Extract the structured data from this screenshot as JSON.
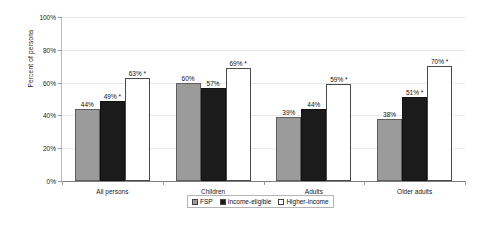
{
  "chart_data": {
    "type": "bar",
    "title": "",
    "subtitle": "",
    "xlabel": "",
    "ylabel": "Percent of persons",
    "ylim": [
      0,
      100
    ],
    "ytick_labels": [
      "100%",
      "80%",
      "60%",
      "40%",
      "20%",
      "0%"
    ],
    "ytick_values": [
      100,
      80,
      60,
      40,
      20,
      0
    ],
    "grid": true,
    "legend_position": "bottom-center",
    "categories": [
      "All persons",
      "Children",
      "Adults",
      "Older adults"
    ],
    "series": [
      {
        "name": "FSP",
        "color": "#9b9b9b",
        "values": [
          44,
          60,
          39,
          38
        ],
        "labels": [
          "44%",
          "60%",
          "39%",
          "38%"
        ]
      },
      {
        "name": "Income-eligible",
        "color": "#1b1b1b",
        "values": [
          49,
          57,
          44,
          51
        ],
        "labels": [
          "49% *",
          "57%",
          "44%",
          "51% *"
        ]
      },
      {
        "name": "Higher-income",
        "color": "#ffffff",
        "values": [
          63,
          69,
          59,
          70
        ],
        "labels": [
          "63% *",
          "69% *",
          "59% *",
          "70% *"
        ]
      }
    ],
    "annotations": [
      "* denotes statistical significance marker on labeled bars"
    ]
  },
  "legend": {
    "items": [
      {
        "label": "FSP",
        "swatch": "gray-swatch"
      },
      {
        "label": "Income-eligible",
        "swatch": "black-swatch"
      },
      {
        "label": "Higher-income",
        "swatch": "white-swatch"
      }
    ]
  }
}
